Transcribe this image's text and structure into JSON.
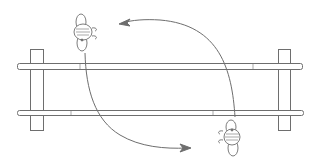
{
  "diagram": {
    "description": "Two figures swapping positions across a double-railed fence, with curved arrows indicating movement",
    "colors": {
      "line": "#6e6e6e",
      "rail_fill": "#ffffff",
      "background": "#ffffff"
    },
    "fence": {
      "posts": [
        {
          "name": "left-post",
          "x": 30,
          "y": 49,
          "w": 14,
          "h": 82
        },
        {
          "name": "right-post",
          "x": 278,
          "y": 49,
          "w": 13,
          "h": 82
        }
      ],
      "rails": [
        {
          "name": "top-rail",
          "x": 17,
          "y": 63,
          "w": 286,
          "h": 7
        },
        {
          "name": "bottom-rail",
          "x": 17,
          "y": 110,
          "w": 287,
          "h": 6
        }
      ]
    },
    "figures": [
      {
        "name": "top-figure",
        "cx": 84,
        "cy": 33,
        "facing": "right"
      },
      {
        "name": "bottom-figure",
        "cx": 231,
        "cy": 137,
        "facing": "left"
      }
    ],
    "arrows": [
      {
        "name": "arrow-bottom-to-top",
        "from": "bottom-figure",
        "to": "top-figure",
        "direction": "up-left"
      },
      {
        "name": "arrow-top-to-bottom",
        "from": "top-figure",
        "to": "bottom-figure",
        "direction": "down-right"
      }
    ]
  }
}
